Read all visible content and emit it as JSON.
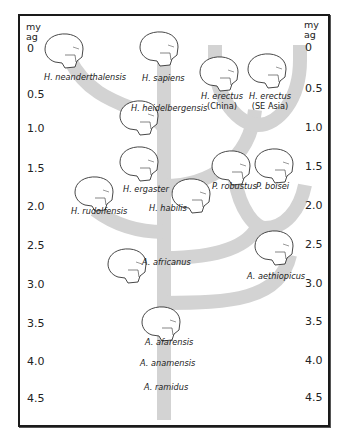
{
  "diagram": {
    "type": "phylogenetic-tree",
    "axis": {
      "unit_line1": "my",
      "unit_line2": "ag",
      "ticks": [
        "0",
        "0.5",
        "1.0",
        "1.5",
        "2.0",
        "2.5",
        "3.0",
        "3.5",
        "4.0",
        "4.5"
      ]
    },
    "colors": {
      "branch": "#d3d3d3",
      "frame": "#1a1a1a",
      "skull_stroke": "#333333",
      "text": "#222222"
    },
    "species": [
      {
        "name": "H. neanderthalensis",
        "sub": "",
        "lineage": "Homo"
      },
      {
        "name": "H. sapiens",
        "sub": "",
        "lineage": "Homo"
      },
      {
        "name": "H. erectus",
        "sub": "(China)",
        "lineage": "Homo"
      },
      {
        "name": "H. erectus",
        "sub": "(SE Asia)",
        "lineage": "Homo"
      },
      {
        "name": "H. heidelbergensis",
        "sub": "",
        "lineage": "Homo"
      },
      {
        "name": "H. ergaster",
        "sub": "",
        "lineage": "Homo"
      },
      {
        "name": "P. robustus",
        "sub": "",
        "lineage": "Paranthropus"
      },
      {
        "name": "P. boisei",
        "sub": "",
        "lineage": "Paranthropus"
      },
      {
        "name": "H. rudolfensis",
        "sub": "",
        "lineage": "Homo"
      },
      {
        "name": "H. habilis",
        "sub": "",
        "lineage": "Homo"
      },
      {
        "name": "A. africanus",
        "sub": "",
        "lineage": "Australopithecus"
      },
      {
        "name": "A. aethiopicus",
        "sub": "",
        "lineage": "Australopithecus"
      },
      {
        "name": "A. afarensis",
        "sub": "",
        "lineage": "Australopithecus"
      },
      {
        "name": "A. anamensis",
        "sub": "",
        "lineage": "Australopithecus"
      },
      {
        "name": "A. ramidus",
        "sub": "",
        "lineage": "Ardipithecus"
      }
    ]
  }
}
